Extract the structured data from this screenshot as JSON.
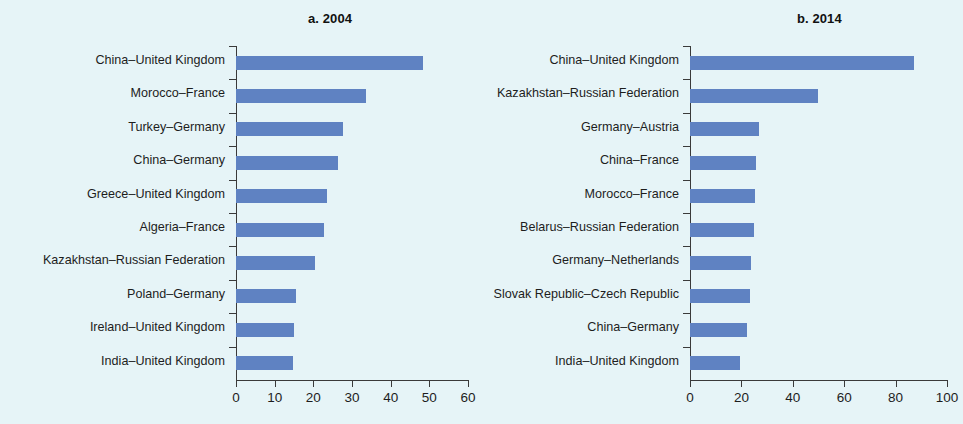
{
  "figure": {
    "background_color": "#e6f4f7",
    "bar_color": "#5f82c2",
    "axis_color": "#3a3a3a"
  },
  "chart_data": [
    {
      "type": "bar",
      "orientation": "horizontal",
      "title": "a. 2004",
      "panel_id": "a",
      "xlabel": "",
      "ylabel": "",
      "xlim": [
        0,
        60
      ],
      "xticks": [
        0,
        10,
        20,
        30,
        40,
        50,
        60
      ],
      "xtick_labels": [
        "0",
        "10",
        "20",
        "30",
        "40",
        "50",
        "60"
      ],
      "grid": false,
      "legend": null,
      "categories": [
        "China–United Kingdom",
        "Morocco–France",
        "Turkey–Germany",
        "China–Germany",
        "Greece–United Kingdom",
        "Algeria–France",
        "Kazakhstan–Russian Federation",
        "Poland–Germany",
        "Ireland–United Kingdom",
        "India–United Kingdom"
      ],
      "values": [
        48.4,
        33.6,
        27.7,
        26.4,
        23.5,
        22.8,
        20.4,
        15.5,
        15.0,
        14.7
      ]
    },
    {
      "type": "bar",
      "orientation": "horizontal",
      "title": "b. 2014",
      "panel_id": "b",
      "xlabel": "",
      "ylabel": "",
      "xlim": [
        0,
        100
      ],
      "xticks": [
        0,
        20,
        40,
        60,
        80,
        100
      ],
      "xtick_labels": [
        "0",
        "20",
        "40",
        "60",
        "80",
        "100"
      ],
      "grid": false,
      "legend": null,
      "categories": [
        "China–United Kingdom",
        "Kazakhstan–Russian Federation",
        "Germany–Austria",
        "China–France",
        "Morocco–France",
        "Belarus–Russian Federation",
        "Germany–Netherlands",
        "Slovak Republic–Czech Republic",
        "China–Germany",
        "India–United Kingdom"
      ],
      "values": [
        87.0,
        49.8,
        26.9,
        25.5,
        25.2,
        25.0,
        23.8,
        23.5,
        22.0,
        19.4
      ]
    }
  ]
}
